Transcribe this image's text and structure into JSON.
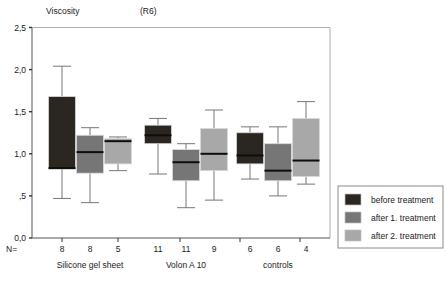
{
  "title": "Viscosity",
  "title_suffix": "(R6)",
  "n_prefix": "N=",
  "legend": {
    "items": [
      {
        "label": "before treatment",
        "color": "#2b2620"
      },
      {
        "label": "after 1. treatment",
        "color": "#767676"
      },
      {
        "label": "after 2. treatment",
        "color": "#a8a8a8"
      }
    ]
  },
  "chart_data": {
    "type": "box",
    "xlabel": "",
    "ylabel": "",
    "ylim": [
      0.0,
      2.5
    ],
    "ytick_labels": [
      "0,0",
      ",5",
      "1,0",
      "1,5",
      "2,0",
      "2,5"
    ],
    "ytick_values": [
      0.0,
      0.5,
      1.0,
      1.5,
      2.0,
      2.5
    ],
    "grid": false,
    "legend_position": "right-outside",
    "categories": [
      "Silicone gel sheet",
      "Volon A 10",
      "controls"
    ],
    "series": [
      {
        "name": "before treatment",
        "color": "#2b2620"
      },
      {
        "name": "after 1. treatment",
        "color": "#767676"
      },
      {
        "name": "after 2. treatment",
        "color": "#a8a8a8"
      }
    ],
    "n_values": [
      [
        8,
        8,
        5
      ],
      [
        11,
        11,
        9
      ],
      [
        6,
        6,
        4
      ]
    ],
    "boxes": [
      {
        "group": "Silicone gel sheet",
        "series": "before treatment",
        "n": 8,
        "whisker_low": 0.47,
        "q1": 0.82,
        "median": 0.83,
        "q3": 1.68,
        "whisker_high": 2.04
      },
      {
        "group": "Silicone gel sheet",
        "series": "after 1. treatment",
        "n": 8,
        "whisker_low": 0.42,
        "q1": 0.77,
        "median": 1.02,
        "q3": 1.22,
        "whisker_high": 1.31
      },
      {
        "group": "Silicone gel sheet",
        "series": "after 2. treatment",
        "n": 5,
        "whisker_low": 0.8,
        "q1": 0.88,
        "median": 1.15,
        "q3": 1.18,
        "whisker_high": 1.2
      },
      {
        "group": "Volon A 10",
        "series": "before treatment",
        "n": 11,
        "whisker_low": 0.76,
        "q1": 1.12,
        "median": 1.22,
        "q3": 1.34,
        "whisker_high": 1.42
      },
      {
        "group": "Volon A 10",
        "series": "after 1. treatment",
        "n": 11,
        "whisker_low": 0.36,
        "q1": 0.68,
        "median": 0.9,
        "q3": 1.05,
        "whisker_high": 1.12
      },
      {
        "group": "Volon A 10",
        "series": "after 2. treatment",
        "n": 9,
        "whisker_low": 0.45,
        "q1": 0.8,
        "median": 1.0,
        "q3": 1.3,
        "whisker_high": 1.52
      },
      {
        "group": "controls",
        "series": "before treatment",
        "n": 6,
        "whisker_low": 0.7,
        "q1": 0.88,
        "median": 0.98,
        "q3": 1.25,
        "whisker_high": 1.32
      },
      {
        "group": "controls",
        "series": "after 1. treatment",
        "n": 6,
        "whisker_low": 0.5,
        "q1": 0.68,
        "median": 0.8,
        "q3": 1.12,
        "whisker_high": 1.32
      },
      {
        "group": "controls",
        "series": "after 2. treatment",
        "n": 4,
        "whisker_low": 0.64,
        "q1": 0.73,
        "median": 0.92,
        "q3": 1.42,
        "whisker_high": 1.62
      }
    ]
  }
}
